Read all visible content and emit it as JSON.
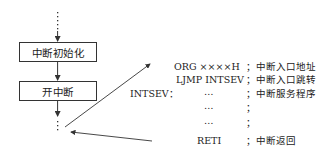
{
  "flowchart": {
    "steps": [
      {
        "label": "中断初始化"
      },
      {
        "label": "开中断"
      }
    ],
    "continuation_top": "⋮",
    "continuation_bottom": "⋮"
  },
  "code": {
    "lines": [
      {
        "label": "",
        "instruction": "ORG ××××H",
        "comment": "；中断入口地址"
      },
      {
        "label": "",
        "instruction": "LJMP INTSEV",
        "comment": "；中断入口跳转"
      },
      {
        "label": "INTSEV：",
        "instruction": "…",
        "comment": "；中断服务程序"
      },
      {
        "label": "",
        "instruction": "…",
        "comment": "；"
      },
      {
        "label": "",
        "instruction": "…",
        "comment": "；"
      },
      {
        "label": "",
        "instruction": "RETI",
        "comment": "；中断返回"
      }
    ]
  }
}
